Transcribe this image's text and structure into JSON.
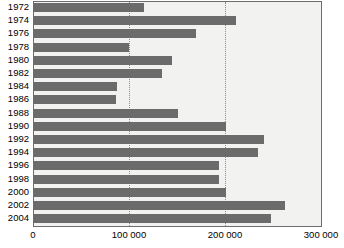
{
  "chart_data": {
    "type": "bar",
    "orientation": "horizontal",
    "title": "",
    "subtitle": "",
    "xlabel": "",
    "ylabel": "",
    "categories": [
      "1972",
      "1974",
      "1976",
      "1978",
      "1980",
      "1982",
      "1984",
      "1986",
      "1988",
      "1990",
      "1992",
      "1994",
      "1996",
      "1998",
      "2000",
      "2002",
      "2004"
    ],
    "values": [
      116000,
      211000,
      170000,
      100000,
      145000,
      134000,
      88000,
      86000,
      151000,
      201000,
      241000,
      234000,
      194000,
      194000,
      201000,
      262000,
      248000
    ],
    "series": [
      {
        "name": "",
        "values": [
          116000,
          211000,
          170000,
          100000,
          145000,
          134000,
          88000,
          86000,
          151000,
          201000,
          241000,
          234000,
          194000,
          194000,
          201000,
          262000,
          248000
        ]
      }
    ],
    "xlim": [
      0,
      300000
    ],
    "xticks": [
      0,
      100000,
      200000,
      300000
    ],
    "xtick_labels": [
      "0",
      "100 000",
      "200 000",
      "300 000"
    ],
    "gridlines": [
      "100 000",
      "200 000"
    ],
    "grid": true,
    "legend": null,
    "legend_position": "none",
    "annotations": [],
    "colors": {
      "bar": "#6b6b6b",
      "plot_background": "#f2f2f0",
      "plot_border": "#6d6d6d",
      "gridline": "#8d8d8d",
      "text": "#000000",
      "page_background": "#ffffff"
    }
  }
}
